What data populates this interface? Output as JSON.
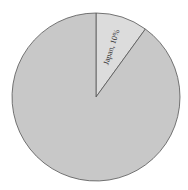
{
  "chart_data": {
    "type": "pie",
    "title": "",
    "slices": [
      {
        "label": "Japan",
        "value": 10,
        "display": "Japan, 10%",
        "color": "#dcdcdc"
      },
      {
        "label": "",
        "value": 90,
        "display": "",
        "color": "#c8c8c8"
      }
    ],
    "start_angle": "12 o'clock",
    "direction": "clockwise",
    "legend": "none"
  }
}
